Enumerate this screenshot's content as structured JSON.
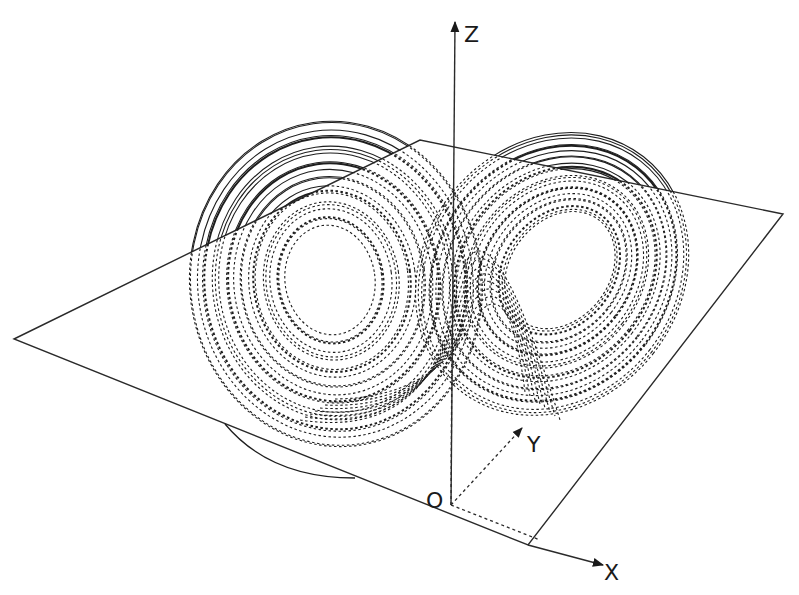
{
  "figure": {
    "title": ""
  },
  "axes": {
    "z_label": "Z",
    "y_label": "Y",
    "x_label": "X",
    "origin_label": "O"
  },
  "geometry": {
    "plane_corners": [
      [
        14,
        339
      ],
      [
        420,
        140
      ],
      [
        783,
        214
      ],
      [
        528,
        545
      ]
    ],
    "origin": [
      451,
      505
    ],
    "z_axis_top": [
      455,
      22
    ],
    "y_axis_tip": [
      522,
      428
    ],
    "x_axis_start": [
      528,
      545
    ],
    "x_axis_tip": [
      603,
      565
    ],
    "x_guide_end": [
      540,
      540
    ]
  },
  "wings": [
    {
      "name": "left-wing",
      "center": [
        330,
        280
      ],
      "rx_min": 45,
      "rx_max": 148,
      "ry_min": 55,
      "ry_max": 165,
      "rotation": -8,
      "count": 22
    },
    {
      "name": "right-wing",
      "center": [
        560,
        270
      ],
      "rx_min": 48,
      "rx_max": 130,
      "ry_min": 62,
      "ry_max": 150,
      "rotation": 38,
      "count": 22
    }
  ],
  "legend_notes": {
    "solid": "trajectory above plane",
    "dashed": "trajectory below plane"
  }
}
